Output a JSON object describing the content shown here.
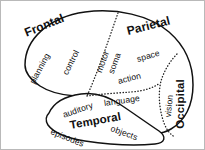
{
  "figure": {
    "kind": "brain-lobe-diagram",
    "background_color": "#ffffff",
    "outline_color": "#111111",
    "divider_color": "#222222",
    "border_color": "#b9b9b9"
  },
  "lobes": [
    {
      "id": "frontal",
      "label": "Frontal",
      "style": "major",
      "x": 24,
      "y": 26,
      "rotation": -22,
      "font_size": 12
    },
    {
      "id": "parietal",
      "label": "Parietal",
      "style": "major",
      "x": 126,
      "y": 24,
      "rotation": -14,
      "font_size": 12
    },
    {
      "id": "occipital",
      "label": "Occipital",
      "style": "major",
      "x": 180,
      "y": 122,
      "rotation": -90,
      "font_size": 11.5
    },
    {
      "id": "temporal",
      "label": "Temporal",
      "style": "major",
      "x": 69,
      "y": 119,
      "rotation": -10,
      "font_size": 11.5
    }
  ],
  "functions": [
    {
      "id": "planning",
      "label": "planning",
      "lobe": "frontal",
      "style": "minor",
      "x": 31,
      "y": 78,
      "rotation": -62
    },
    {
      "id": "control",
      "label": "control",
      "lobe": "frontal",
      "style": "minor",
      "x": 64,
      "y": 69,
      "rotation": -63
    },
    {
      "id": "motor",
      "label": "motor",
      "lobe": "frontal",
      "style": "minor",
      "x": 98,
      "y": 67,
      "rotation": -70
    },
    {
      "id": "soma",
      "label": "soma",
      "lobe": "parietal",
      "style": "minor",
      "x": 110,
      "y": 68,
      "rotation": -70
    },
    {
      "id": "space",
      "label": "space",
      "lobe": "parietal",
      "style": "minor",
      "x": 136,
      "y": 54,
      "rotation": -16
    },
    {
      "id": "action",
      "label": "action",
      "lobe": "parietal",
      "style": "minor",
      "x": 117,
      "y": 76,
      "rotation": -14
    },
    {
      "id": "vision",
      "label": "vision",
      "lobe": "occipital",
      "style": "minor",
      "x": 167,
      "y": 112,
      "rotation": -84
    },
    {
      "id": "auditory",
      "label": "auditory",
      "lobe": "temporal",
      "style": "minor",
      "x": 62,
      "y": 110,
      "rotation": -19
    },
    {
      "id": "language",
      "label": "language",
      "lobe": "temporal",
      "style": "minor",
      "x": 103,
      "y": 98,
      "rotation": -8
    },
    {
      "id": "episodes",
      "label": "episodes",
      "lobe": "temporal",
      "style": "minor",
      "x": 50,
      "y": 126,
      "rotation": 22
    },
    {
      "id": "objects",
      "label": "objects",
      "lobe": "temporal",
      "style": "minor",
      "x": 110,
      "y": 123,
      "rotation": 20
    }
  ]
}
